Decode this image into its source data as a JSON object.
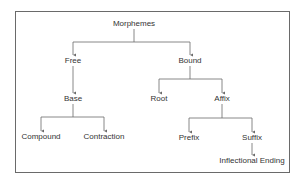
{
  "diagram": {
    "type": "tree",
    "colors": {
      "line": "#6a6a6a",
      "text": "#333333",
      "frame": "#6a6a6a",
      "background": "#ffffff"
    },
    "nodes": {
      "morphemes": {
        "label": "Morphemes",
        "x": 134,
        "y": 24
      },
      "free": {
        "label": "Free",
        "x": 73,
        "y": 61
      },
      "bound": {
        "label": "Bound",
        "x": 190,
        "y": 61
      },
      "base": {
        "label": "Base",
        "x": 73,
        "y": 99
      },
      "root": {
        "label": "Root",
        "x": 159,
        "y": 99
      },
      "affix": {
        "label": "Affix",
        "x": 222,
        "y": 99
      },
      "compound": {
        "label": "Compound",
        "x": 41,
        "y": 137
      },
      "contraction": {
        "label": "Contraction",
        "x": 104,
        "y": 137
      },
      "prefix": {
        "label": "Prefix",
        "x": 189,
        "y": 138
      },
      "suffix": {
        "label": "Suffix",
        "x": 252,
        "y": 138
      },
      "inflectional_ending": {
        "label": "Inflectional Ending",
        "x": 252,
        "y": 161
      }
    },
    "edges": [
      {
        "from": "Morphemes",
        "to": "Free"
      },
      {
        "from": "Morphemes",
        "to": "Bound"
      },
      {
        "from": "Free",
        "to": "Base"
      },
      {
        "from": "Bound",
        "to": "Root"
      },
      {
        "from": "Bound",
        "to": "Affix"
      },
      {
        "from": "Base",
        "to": "Compound"
      },
      {
        "from": "Base",
        "to": "Contraction"
      },
      {
        "from": "Affix",
        "to": "Prefix"
      },
      {
        "from": "Affix",
        "to": "Suffix"
      },
      {
        "from": "Suffix",
        "to": "Inflectional Ending"
      }
    ]
  }
}
